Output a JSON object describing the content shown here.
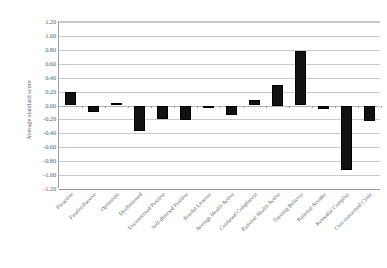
{
  "chart_data": {
    "type": "bar",
    "title": "",
    "xlabel": "",
    "ylabel": "Average standard score",
    "ylim": [
      -1.2,
      1.2
    ],
    "ytick_step": 0.2,
    "grid": true,
    "legend": "none",
    "orientation": "vertical",
    "bar_color": "#111111",
    "categories": [
      "Proactive",
      "Fatalist/Passive",
      "Optimistic",
      "Disillusioned",
      "Unconcerned Positive",
      "Self-directed Positive",
      "Fearful Listener",
      "Average Health Active",
      "Confused Complacent",
      "Rational Health Active",
      "Trusting Believer",
      "Rational Avoider",
      "Remedial Complier",
      "Cost-concerned Cynic"
    ],
    "values": [
      0.2,
      -0.09,
      0.04,
      -0.37,
      -0.19,
      -0.21,
      -0.02,
      -0.14,
      0.08,
      0.3,
      0.78,
      -0.05,
      -0.92,
      -0.22
    ],
    "ytick_labels": [
      "1.20",
      "1.00",
      "0.80",
      "0.60",
      "0.40",
      "0.20",
      "0.00",
      "-0.20",
      "-0.40",
      "-0.60",
      "-0.80",
      "-1.00",
      "-1.20"
    ],
    "ytick_values": [
      1.2,
      1.0,
      0.8,
      0.6,
      0.4,
      0.2,
      0.0,
      -0.2,
      -0.4,
      -0.6,
      -0.8,
      -1.0,
      -1.2
    ]
  }
}
